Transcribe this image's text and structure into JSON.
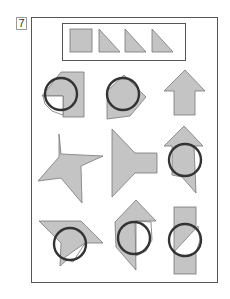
{
  "puzzle": {
    "number": "7",
    "key": {
      "pieces": [
        "square",
        "right-triangle",
        "right-triangle",
        "right-triangle"
      ]
    },
    "grid": {
      "rows": 3,
      "cols": 3,
      "items": [
        {
          "row": 1,
          "col": 1,
          "shape": "rectangle with triangle notch and circle, white quarter cut"
        },
        {
          "row": 1,
          "col": 2,
          "shape": "pentagon with circle overlay"
        },
        {
          "row": 1,
          "col": 3,
          "shape": "up arrow"
        },
        {
          "row": 2,
          "col": 1,
          "shape": "four-point pinwheel star"
        },
        {
          "row": 2,
          "col": 2,
          "shape": "triangle with rectangular stem"
        },
        {
          "row": 2,
          "col": 3,
          "shape": "arrow-house with circle overlay"
        },
        {
          "row": 3,
          "col": 1,
          "shape": "parallelogram with circle overlay, white triangle cut"
        },
        {
          "row": 3,
          "col": 2,
          "shape": "hexagonal shape with circle overlay"
        },
        {
          "row": 3,
          "col": 3,
          "shape": "vertical rectangle with circle, white half cut"
        }
      ]
    },
    "colors": {
      "fill": "#c4c4c4",
      "stroke": "#333333",
      "frame": "#555555"
    }
  }
}
